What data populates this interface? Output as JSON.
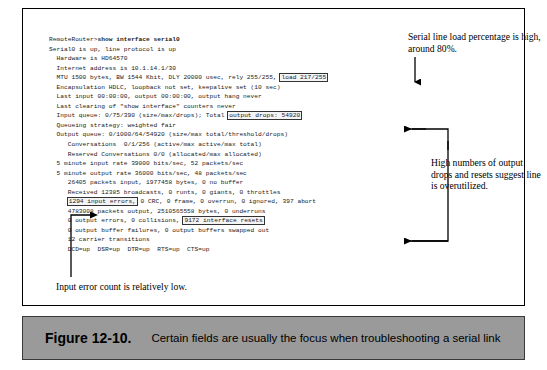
{
  "figure": {
    "caption_number": "Figure 12-10.",
    "caption_text": "Certain fields are usually the focus when troubleshooting a serial link"
  },
  "terminal": {
    "prompt": "RemoteRouter>",
    "command": "show interface serial0",
    "lines": [
      {
        "text": "Serial0 is up, line protocol is up"
      },
      {
        "text": "  Hardware is HD64570"
      },
      {
        "text": "  Internet address is 10.1.14.1/30"
      },
      {
        "pre": "  MTU 1500 bytes, BW 1544 Kbit, DLY 20000 usec, rely 255/255, ",
        "boxed": "load 217/255",
        "post": ""
      },
      {
        "text": "  Encapsulation HDLC, loopback not set, keepalive set (10 sec)"
      },
      {
        "text": "  Last input 00:00:00, output 00:00:00, output hang never"
      },
      {
        "text": "  Last clearing of \"show interface\" counters never"
      },
      {
        "pre": "  Input queue: 0/75/390 (size/max/drops); Total ",
        "boxed": "output drops: 54920",
        "post": ""
      },
      {
        "text": "  Queueing strategy: weighted fair"
      },
      {
        "text": "  Output queue: 0/1000/64/54920 (size/max total/threshold/drops)"
      },
      {
        "text": "     Conversations  0/1/256 (active/max active/max total)"
      },
      {
        "text": "     Reserved Conversations 0/0 (allocated/max allocated)"
      },
      {
        "text": "  5 minute input rate 39000 bits/sec, 52 packets/sec"
      },
      {
        "text": "  5 minute output rate 36000 bits/sec, 48 packets/sec"
      },
      {
        "text": "     26405 packets input, 1977458 bytes, 0 no buffer"
      },
      {
        "text": "     Received 12385 broadcasts, 0 runts, 0 giants, 0 throttles"
      },
      {
        "pre": "     ",
        "boxed": "1294 input errors,",
        "post": " 0 CRC, 0 frame, 0 overrun, 0 ignored, 397 abort"
      },
      {
        "text": "     4783008 packets output, 2510565558 bytes, 0 underruns"
      },
      {
        "pre": "     0 output errors, 0 collisions, ",
        "boxed": "9172 interface resets",
        "post": ""
      },
      {
        "text": "     0 output buffer failures, 0 output buffers swapped out"
      },
      {
        "text": "     12 carrier transitions"
      },
      {
        "text": "     DCD=up  DSR=up  DTR=up  RTS=up  CTS=up"
      }
    ]
  },
  "callouts": {
    "load": "Serial line load percentage is high, around 80%.",
    "drops": "High numbers of output drops and resets suggest line is overutilized.",
    "input_errors": "Input error count is relatively low."
  },
  "colors": {
    "caption_bar": "#9a9a9a",
    "frame_border": "#000000",
    "highlight_box": "#f4f4f4",
    "text": "#000000"
  }
}
